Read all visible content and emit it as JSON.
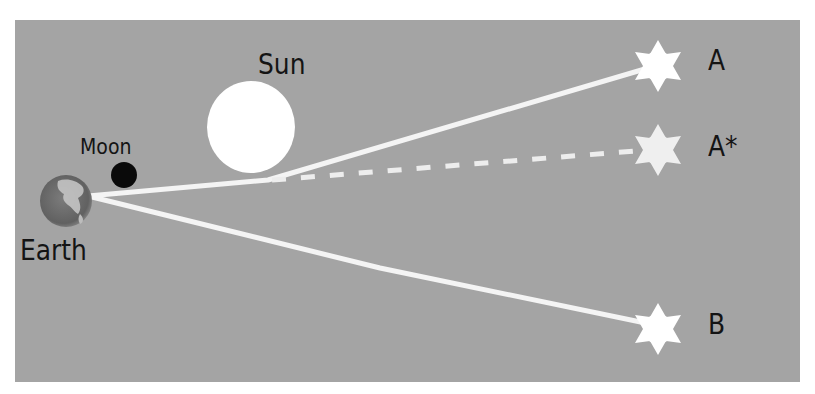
{
  "diagram": {
    "background_color": "#a4a4a4",
    "light_color": "#f4f4f4",
    "label_color": "#141414",
    "labels": {
      "sun": "Sun",
      "moon": "Moon",
      "earth": "Earth",
      "star_a": "A",
      "star_a_apparent": "A*",
      "star_b": "B"
    },
    "bodies": [
      {
        "id": "earth",
        "label": "Earth",
        "shape": "circle",
        "color": "#6e6e6e"
      },
      {
        "id": "moon",
        "label": "Moon",
        "shape": "circle",
        "color": "#0a0a0a"
      },
      {
        "id": "sun",
        "label": "Sun",
        "shape": "circle",
        "color": "#ffffff"
      },
      {
        "id": "star-a",
        "label": "A",
        "shape": "six-point-star",
        "color": "#ffffff"
      },
      {
        "id": "star-a-apparent",
        "label": "A*",
        "shape": "six-point-star",
        "color": "#f0f0f0"
      },
      {
        "id": "star-b",
        "label": "B",
        "shape": "six-point-star",
        "color": "#ffffff"
      }
    ],
    "rays": [
      {
        "id": "ray-a",
        "from": "earth",
        "via": "sun-limb",
        "to": "star-a",
        "style": "solid"
      },
      {
        "id": "ray-a-apparent",
        "from": "sun-limb",
        "to": "star-a-apparent",
        "style": "dashed"
      },
      {
        "id": "ray-b",
        "from": "earth",
        "to": "star-b",
        "style": "solid"
      }
    ]
  }
}
